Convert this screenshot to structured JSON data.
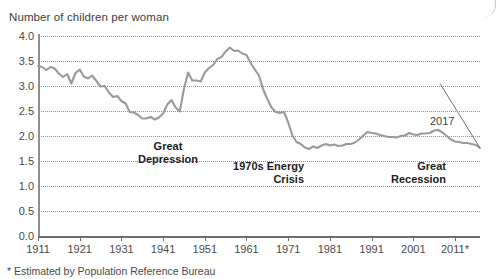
{
  "axis_title": "Number of children per woman",
  "footnote": "* Estimated by Population Reference Bureau",
  "endpoint_label": "2017",
  "annotations": {
    "depression": "Great\nDepression",
    "energy_crisis": "1970s Energy\nCrisis",
    "recession": "Great\nRecession"
  },
  "colors": {
    "line": "#9a9a9a",
    "grid": "#8d8d8d",
    "axis": "#6e6e6e",
    "text": "#3d3d3d",
    "annotation": "#1d1d1d",
    "background": "#ffffff"
  },
  "chart_data": {
    "type": "line",
    "title": "Number of children per woman",
    "xlabel": "",
    "ylabel": "Number of children per woman",
    "xlim": [
      1911,
      2017
    ],
    "ylim": [
      0.0,
      4.0
    ],
    "grid": true,
    "legend": false,
    "ytick_labels": [
      "4.0",
      "3.5",
      "3.0",
      "2.5",
      "2.0",
      "1.5",
      "1.0",
      "0.5",
      "0.0"
    ],
    "ytick_values": [
      4.0,
      3.5,
      3.0,
      2.5,
      2.0,
      1.5,
      1.0,
      0.5,
      0.0
    ],
    "xtick_labels": [
      "1911",
      "1921",
      "1931",
      "1941",
      "1951",
      "1961",
      "1971",
      "1981",
      "1991",
      "2001",
      "2011*"
    ],
    "xtick_values": [
      1911,
      1921,
      1931,
      1941,
      1951,
      1961,
      1971,
      1981,
      1991,
      2001,
      2011
    ],
    "series": [
      {
        "name": "Total fertility rate",
        "x": [
          1911,
          1912,
          1913,
          1914,
          1915,
          1916,
          1917,
          1918,
          1919,
          1920,
          1921,
          1922,
          1923,
          1924,
          1925,
          1926,
          1927,
          1928,
          1929,
          1930,
          1931,
          1932,
          1933,
          1934,
          1935,
          1936,
          1937,
          1938,
          1939,
          1940,
          1941,
          1942,
          1943,
          1944,
          1945,
          1946,
          1947,
          1948,
          1949,
          1950,
          1951,
          1952,
          1953,
          1954,
          1955,
          1956,
          1957,
          1958,
          1959,
          1960,
          1961,
          1962,
          1963,
          1964,
          1965,
          1966,
          1967,
          1968,
          1969,
          1970,
          1971,
          1972,
          1973,
          1974,
          1975,
          1976,
          1977,
          1978,
          1979,
          1980,
          1981,
          1982,
          1983,
          1984,
          1985,
          1986,
          1987,
          1988,
          1989,
          1990,
          1991,
          1992,
          1993,
          1994,
          1995,
          1996,
          1997,
          1998,
          1999,
          2000,
          2001,
          2002,
          2003,
          2004,
          2005,
          2006,
          2007,
          2008,
          2009,
          2010,
          2011,
          2012,
          2013,
          2014,
          2015,
          2016,
          2017
        ],
        "values": [
          3.4,
          3.38,
          3.32,
          3.38,
          3.35,
          3.25,
          3.18,
          3.24,
          3.05,
          3.26,
          3.33,
          3.19,
          3.15,
          3.21,
          3.1,
          2.99,
          3.0,
          2.87,
          2.78,
          2.8,
          2.7,
          2.65,
          2.48,
          2.47,
          2.42,
          2.35,
          2.35,
          2.38,
          2.33,
          2.37,
          2.45,
          2.63,
          2.72,
          2.57,
          2.49,
          2.94,
          3.27,
          3.11,
          3.11,
          3.09,
          3.27,
          3.36,
          3.42,
          3.54,
          3.58,
          3.69,
          3.77,
          3.7,
          3.71,
          3.65,
          3.62,
          3.46,
          3.33,
          3.21,
          2.93,
          2.74,
          2.57,
          2.48,
          2.46,
          2.48,
          2.27,
          2.01,
          1.88,
          1.84,
          1.77,
          1.74,
          1.79,
          1.76,
          1.81,
          1.84,
          1.81,
          1.83,
          1.8,
          1.81,
          1.84,
          1.84,
          1.87,
          1.93,
          2.01,
          2.08,
          2.06,
          2.05,
          2.02,
          2.0,
          1.98,
          1.98,
          1.97,
          2.0,
          2.01,
          2.06,
          2.03,
          2.02,
          2.05,
          2.05,
          2.06,
          2.11,
          2.12,
          2.07,
          2.0,
          1.93,
          1.89,
          1.88,
          1.86,
          1.86,
          1.84,
          1.82,
          1.76
        ]
      }
    ],
    "annotations": [
      {
        "label": "Great Depression",
        "x": 1933,
        "y": 2.15
      },
      {
        "label": "1970s Energy Crisis",
        "x": 1975,
        "y": 1.55
      },
      {
        "label": "Great Recession",
        "x": 2008,
        "y": 1.55
      },
      {
        "label": "2017",
        "x": 2017,
        "y": 1.76
      }
    ]
  }
}
